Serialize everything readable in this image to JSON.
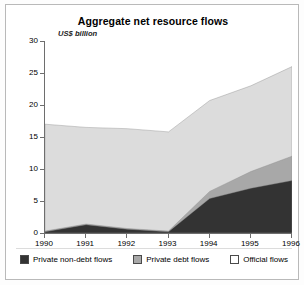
{
  "chart_data": {
    "type": "area",
    "title": "Aggregate net resource flows",
    "ylabel": "US$ billion",
    "xlabel": "",
    "categories": [
      "1990",
      "1991",
      "1992",
      "1993",
      "1994",
      "1995",
      "1996"
    ],
    "x": [
      1990,
      1991,
      1992,
      1993,
      1994,
      1995,
      1996
    ],
    "ylim": [
      0,
      30
    ],
    "yticks": [
      0,
      5,
      10,
      15,
      20,
      25,
      30
    ],
    "grid": false,
    "stacked": true,
    "legend_position": "bottom",
    "series": [
      {
        "name": "Private non-debt flows",
        "color": "#333333",
        "values": [
          0.2,
          1.3,
          0.6,
          0.2,
          5.4,
          7.0,
          8.2
        ]
      },
      {
        "name": "Private debt flows",
        "color": "#a8a8a8",
        "values": [
          0.1,
          0.1,
          0.1,
          0.1,
          1.1,
          2.6,
          3.8
        ]
      },
      {
        "name": "Official flows",
        "color": "#dcdcdc",
        "values": [
          16.7,
          15.1,
          15.6,
          15.5,
          14.2,
          13.4,
          14.0
        ]
      }
    ],
    "totals": [
      17.0,
      16.5,
      16.3,
      15.8,
      20.7,
      23.0,
      26.0
    ],
    "annotations": []
  },
  "legend": {
    "items": [
      {
        "label": "Private non-debt flows",
        "color": "#333333"
      },
      {
        "label": "Private debt flows",
        "color": "#a8a8a8"
      },
      {
        "label": "Official flows",
        "color": "#ffffff"
      }
    ]
  }
}
